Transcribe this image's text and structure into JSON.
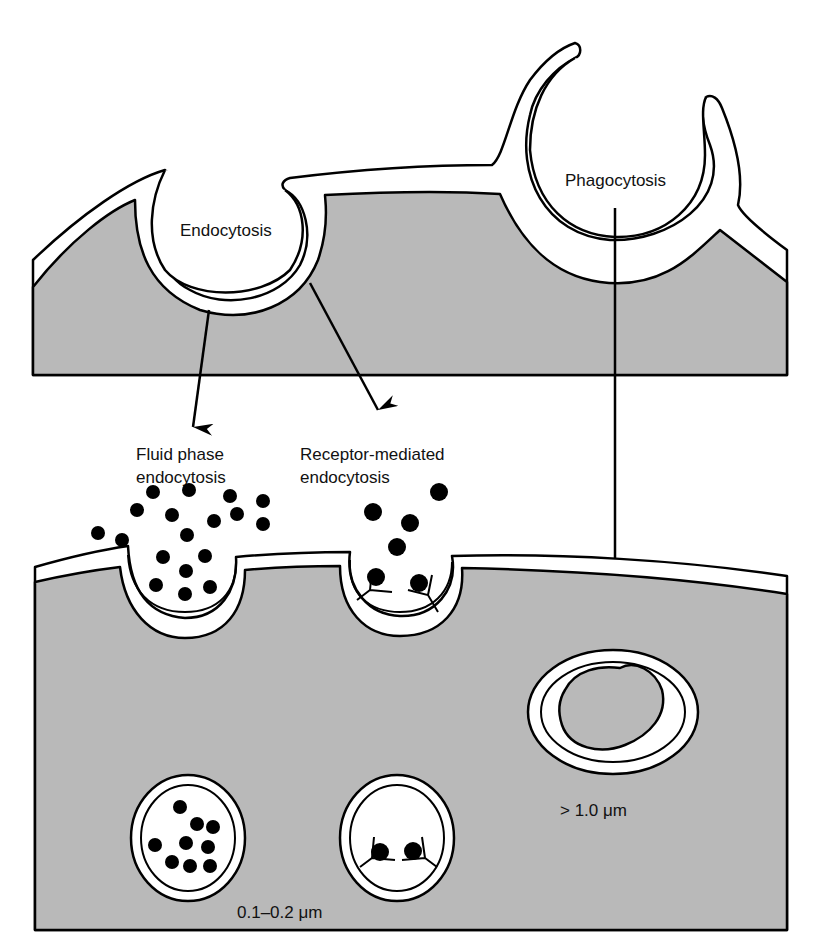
{
  "figure": {
    "type": "biology-diagram"
  },
  "colors": {
    "cytoplasm": "#b9b9b9",
    "membrane": "#ffffff",
    "outline": "#000000",
    "background": "#ffffff"
  },
  "labels": {
    "endocytosis": "Endocytosis",
    "phagocytosis": "Phagocytosis",
    "fluid_phase_line1": "Fluid phase",
    "fluid_phase_line2": "endocytosis",
    "receptor_line1": "Receptor-mediated",
    "receptor_line2": "endocytosis",
    "small_vesicle_size": "0.1–0.2 μm",
    "phagosome_size": "> 1.0 μm"
  },
  "particles": {
    "fluid_outside": [
      [
        98,
        533
      ],
      [
        122,
        540
      ],
      [
        137,
        510
      ],
      [
        153,
        492
      ],
      [
        172,
        515
      ],
      [
        189,
        490
      ],
      [
        187,
        535
      ],
      [
        214,
        521
      ],
      [
        230,
        496
      ],
      [
        237,
        514
      ],
      [
        263,
        501
      ],
      [
        263,
        524
      ],
      [
        163,
        557
      ],
      [
        205,
        556
      ],
      [
        186,
        571
      ]
    ],
    "fluid_in_pit": [
      [
        156,
        585
      ],
      [
        185,
        594
      ],
      [
        210,
        587
      ]
    ],
    "receptor_outside": [
      [
        439,
        492
      ],
      [
        373,
        512
      ],
      [
        410,
        523
      ],
      [
        397,
        547
      ]
    ],
    "receptor_bound_pit": [
      [
        376,
        577
      ],
      [
        419,
        583
      ]
    ],
    "fluid_vesicle": [
      [
        180,
        807
      ],
      [
        197,
        824
      ],
      [
        213,
        827
      ],
      [
        155,
        845
      ],
      [
        186,
        843
      ],
      [
        208,
        847
      ],
      [
        172,
        862
      ],
      [
        190,
        866
      ],
      [
        210,
        866
      ]
    ],
    "receptor_vesicle": [
      [
        380,
        852
      ],
      [
        413,
        851
      ]
    ]
  }
}
